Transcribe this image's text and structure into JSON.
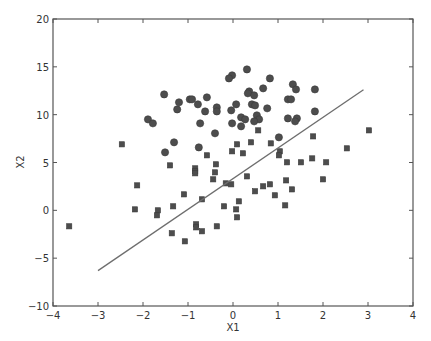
{
  "chart_data": {
    "type": "scatter",
    "title": "",
    "xlabel": "X1",
    "ylabel": "X2",
    "xlim": [
      -4,
      4
    ],
    "ylim": [
      -10,
      20
    ],
    "xticks": [
      -4,
      -3,
      -2,
      -1,
      0,
      1,
      2,
      3,
      4
    ],
    "yticks": [
      -10,
      -5,
      0,
      5,
      10,
      15,
      20
    ],
    "grid": false,
    "legend": null,
    "colors": {
      "marker": "#4d4d4d",
      "line": "#6e6e6e",
      "axis": "#555555"
    },
    "series": [
      {
        "name": "class 1",
        "marker": "circle",
        "points": [
          [
            -1.53,
            12.12
          ],
          [
            -1.2,
            11.29
          ],
          [
            -1.24,
            10.55
          ],
          [
            -1.89,
            9.51
          ],
          [
            -1.78,
            9.09
          ],
          [
            -1.31,
            7.11
          ],
          [
            -1.51,
            6.06
          ],
          [
            -0.96,
            11.6
          ],
          [
            -0.91,
            11.6
          ],
          [
            -0.58,
            11.81
          ],
          [
            -0.78,
            11.08
          ],
          [
            -0.62,
            10.34
          ],
          [
            -0.36,
            10.76
          ],
          [
            -0.36,
            10.34
          ],
          [
            -0.73,
            9.09
          ],
          [
            -0.4,
            8.05
          ],
          [
            -0.76,
            6.58
          ],
          [
            0.31,
            14.73
          ],
          [
            -0.02,
            14.11
          ],
          [
            -0.09,
            13.79
          ],
          [
            0.82,
            13.79
          ],
          [
            0.67,
            12.75
          ],
          [
            0.36,
            12.43
          ],
          [
            0.33,
            12.23
          ],
          [
            0.47,
            12.02
          ],
          [
            0.07,
            11.08
          ],
          [
            -0.04,
            10.45
          ],
          [
            0.42,
            11.08
          ],
          [
            0.49,
            10.97
          ],
          [
            0.76,
            10.66
          ],
          [
            0.18,
            9.72
          ],
          [
            0.27,
            9.51
          ],
          [
            0.53,
            9.93
          ],
          [
            0.58,
            9.51
          ],
          [
            0.47,
            9.3
          ],
          [
            -0.02,
            9.09
          ],
          [
            0.18,
            8.78
          ],
          [
            1.02,
            7.63
          ],
          [
            1.33,
            13.17
          ],
          [
            1.4,
            12.64
          ],
          [
            1.82,
            12.64
          ],
          [
            1.22,
            11.6
          ],
          [
            1.29,
            11.6
          ],
          [
            1.82,
            10.34
          ],
          [
            1.22,
            9.61
          ],
          [
            1.42,
            9.61
          ],
          [
            1.38,
            9.3
          ]
        ]
      },
      {
        "name": "class 2",
        "marker": "square",
        "points": [
          [
            -3.64,
            -1.67
          ],
          [
            -2.47,
            6.9
          ],
          [
            -2.13,
            2.61
          ],
          [
            -2.18,
            0.1
          ],
          [
            -1.67,
            0.0
          ],
          [
            -1.69,
            -0.52
          ],
          [
            -1.4,
            4.7
          ],
          [
            -1.33,
            0.42
          ],
          [
            -1.36,
            -2.4
          ],
          [
            -1.07,
            -3.24
          ],
          [
            -1.09,
            1.67
          ],
          [
            -0.84,
            4.39
          ],
          [
            -0.84,
            4.08
          ],
          [
            -0.84,
            3.87
          ],
          [
            -0.82,
            -1.46
          ],
          [
            -0.82,
            -1.78
          ],
          [
            -0.69,
            -2.19
          ],
          [
            -0.58,
            5.75
          ],
          [
            -0.38,
            4.81
          ],
          [
            -0.4,
            3.97
          ],
          [
            -0.44,
            3.24
          ],
          [
            -0.69,
            1.15
          ],
          [
            -0.36,
            -1.67
          ],
          [
            -0.2,
            0.42
          ],
          [
            -0.16,
            2.82
          ],
          [
            -0.04,
            2.72
          ],
          [
            0.09,
            6.9
          ],
          [
            -0.02,
            6.17
          ],
          [
            0.22,
            5.96
          ],
          [
            0.4,
            7.11
          ],
          [
            0.13,
            0.94
          ],
          [
            0.07,
            0.1
          ],
          [
            0.09,
            -0.73
          ],
          [
            0.31,
            3.55
          ],
          [
            0.56,
            8.36
          ],
          [
            0.49,
            1.99
          ],
          [
            0.67,
            2.51
          ],
          [
            0.82,
            2.72
          ],
          [
            0.93,
            1.57
          ],
          [
            0.84,
            7.0
          ],
          [
            1.04,
            6.17
          ],
          [
            1.02,
            5.75
          ],
          [
            1.18,
            3.13
          ],
          [
            1.16,
            0.52
          ],
          [
            1.2,
            5.02
          ],
          [
            1.31,
            2.19
          ],
          [
            1.51,
            5.02
          ],
          [
            1.76,
            5.43
          ],
          [
            1.78,
            7.73
          ],
          [
            2.07,
            5.02
          ],
          [
            2.0,
            3.24
          ],
          [
            2.53,
            6.48
          ],
          [
            3.02,
            8.36
          ]
        ]
      }
    ],
    "lines": [
      {
        "name": "decision boundary",
        "points": [
          [
            -3.0,
            -6.3
          ],
          [
            2.9,
            12.6
          ]
        ]
      }
    ]
  }
}
